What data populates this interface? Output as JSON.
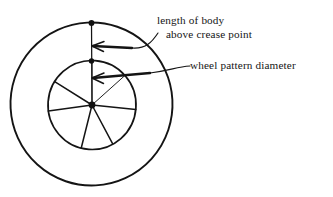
{
  "figure": {
    "background_color": "#ffffff",
    "ink_color": "#141414",
    "annotations": [
      {
        "id": "length-of-body",
        "line1": "length of body",
        "line2": "above crease point",
        "text_x": 157,
        "text_y": 24,
        "line_height": 13.5,
        "arrow_tip": {
          "x": 92,
          "y": 46
        },
        "arrow_tail": {
          "x": 132,
          "y": 48
        },
        "leader": "M 132 48 C 146 49 152 42 158 33"
      },
      {
        "id": "wheel-pattern-diameter",
        "line1": "wheel pattern diameter",
        "line2": "",
        "text_x": 190,
        "text_y": 69,
        "line_height": 13.5,
        "arrow_tip": {
          "x": 92,
          "y": 78
        },
        "arrow_tail": {
          "x": 150,
          "y": 73
        },
        "leader": "M 150 73 C 172 70 176 67 190 66"
      }
    ],
    "outer_circle": {
      "cx": 91.5,
      "cy": 104,
      "r": 81,
      "label": "outer body circle"
    },
    "inner_circle": {
      "cx": 92,
      "cy": 105,
      "r": 44,
      "label": "wheel pattern circle"
    },
    "axis_line": {
      "x1": 91.5,
      "y1": 23,
      "x2": 92,
      "y2": 105,
      "label": "vertical construction axis"
    },
    "points": [
      {
        "id": "top-point",
        "x": 91.5,
        "y": 23,
        "r": 2.9,
        "label": "top of body"
      },
      {
        "id": "crease-point",
        "x": 91.5,
        "y": 61,
        "r": 2.7,
        "label": "crease point"
      },
      {
        "id": "hub-point",
        "x": 92,
        "y": 105,
        "r": 3.4,
        "label": "wheel hub centre"
      }
    ],
    "spokes": [
      {
        "id": "spoke-1",
        "angle_deg": 270,
        "weight": "light",
        "label": "spoke up"
      },
      {
        "id": "spoke-2",
        "angle_deg": 318,
        "weight": "light",
        "label": "spoke upper right"
      },
      {
        "id": "spoke-3",
        "angle_deg": 6,
        "weight": "heavy",
        "label": "spoke right"
      },
      {
        "id": "spoke-4",
        "angle_deg": 62,
        "weight": "heavy",
        "label": "spoke lower right"
      },
      {
        "id": "spoke-5",
        "angle_deg": 104,
        "weight": "heavy",
        "label": "spoke bottom"
      },
      {
        "id": "spoke-6",
        "angle_deg": 172,
        "weight": "heavy",
        "label": "spoke left"
      },
      {
        "id": "spoke-7",
        "angle_deg": 212,
        "weight": "heavy",
        "label": "spoke upper left"
      }
    ]
  }
}
